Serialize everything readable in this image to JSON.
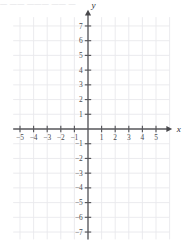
{
  "header": {
    "partial_text": "— —— ——— —— —"
  },
  "chart_data": {
    "type": "scatter",
    "title": "",
    "xlabel": "x",
    "ylabel": "y",
    "xlim": [
      -5.5,
      6.0
    ],
    "ylim": [
      -7.5,
      7.6
    ],
    "xticks": [
      -5,
      -4,
      -3,
      -2,
      -1,
      1,
      2,
      3,
      4,
      5
    ],
    "yticks": [
      7,
      6,
      5,
      4,
      3,
      2,
      1,
      -1,
      -2,
      -3,
      -4,
      -5,
      -6,
      -7
    ],
    "xtick_labels": [
      "−5",
      "−4",
      "−3",
      "−2",
      "−1",
      "1",
      "2",
      "3",
      "4",
      "5"
    ],
    "ytick_labels": [
      "7",
      "6",
      "5",
      "4",
      "3",
      "2",
      "1",
      "−1",
      "−2",
      "−3",
      "−4",
      "−5",
      "−6",
      "−7"
    ],
    "grid": true,
    "legend": null,
    "series": [],
    "annotations": [],
    "axis_arrows": [
      "x-positive",
      "y-positive"
    ],
    "colors": {
      "grid": "#e9e9ec",
      "axis": "#58585c",
      "label": "#4a4a4e",
      "background": "#ffffff"
    }
  }
}
